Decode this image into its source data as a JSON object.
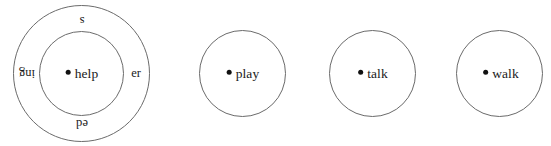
{
  "figure": {
    "background_color": "#ffffff",
    "stroke_color": "#6b6b6b",
    "text_color": "#1a1a1a",
    "dot_color": "#111111"
  },
  "groups": [
    {
      "id": "help-group",
      "center_word": "help",
      "has_outer_ring": true,
      "affixes": [
        {
          "label": "s",
          "position": "top",
          "rotation": 180
        },
        {
          "label": "er",
          "position": "right",
          "rotation": 0
        },
        {
          "label": "ed",
          "position": "bottom",
          "rotation": 180
        },
        {
          "label": "ing",
          "position": "left",
          "rotation": 180
        }
      ]
    },
    {
      "id": "play-group",
      "center_word": "play",
      "has_outer_ring": false,
      "affixes": []
    },
    {
      "id": "talk-group",
      "center_word": "talk",
      "has_outer_ring": false,
      "affixes": []
    },
    {
      "id": "walk-group",
      "center_word": "walk",
      "has_outer_ring": false,
      "affixes": []
    }
  ]
}
